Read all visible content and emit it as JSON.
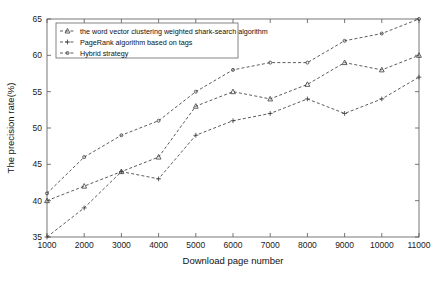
{
  "chart_data": {
    "type": "line",
    "title": "",
    "xlabel": "Download page number",
    "ylabel": "The precision rate(%)",
    "x": [
      1000,
      2000,
      3000,
      4000,
      5000,
      6000,
      7000,
      8000,
      9000,
      10000,
      11000
    ],
    "xtick_labels": [
      "1000",
      "2000",
      "3000",
      "4000",
      "5000",
      "6000",
      "7000",
      "8000",
      "9000",
      "10000",
      "11000"
    ],
    "ytick_labels": [
      "35",
      "40",
      "45",
      "50",
      "55",
      "60",
      "65"
    ],
    "yticks": [
      35,
      40,
      45,
      50,
      55,
      60,
      65
    ],
    "xlim": [
      1000,
      11000
    ],
    "ylim": [
      35,
      65
    ],
    "grid": false,
    "legend_position": "upper-left",
    "line_color": "#4a4a4a",
    "series": [
      {
        "name": "the word vector clustering weighted shark-search algorithm",
        "marker": "triangle",
        "values": [
          40,
          42,
          44,
          46,
          53,
          55,
          54,
          56,
          59,
          58,
          60
        ]
      },
      {
        "name": "PageRank algorithm based on tags",
        "marker": "plus",
        "values": [
          35,
          39,
          44,
          43,
          49,
          51,
          52,
          54,
          52,
          54,
          57
        ]
      },
      {
        "name": "Hybrid strategy",
        "marker": "dot",
        "values": [
          41,
          46,
          49,
          51,
          55,
          58,
          59,
          59,
          62,
          63,
          65
        ]
      }
    ]
  },
  "legend": {
    "entries": [
      "the word vector clustering weighted shark-search algorithm",
      "PageRank algorithm based on tags",
      "Hybrid strategy"
    ]
  }
}
